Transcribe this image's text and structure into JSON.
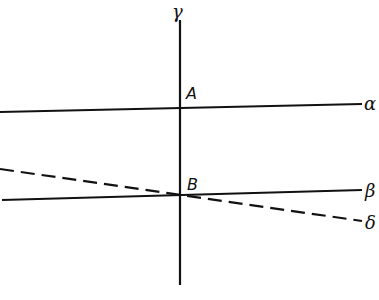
{
  "diagram": {
    "lines": {
      "gamma": {
        "label": "γ",
        "style": "solid",
        "x1": 180,
        "y1": 20,
        "x2": 180,
        "y2": 285
      },
      "alpha": {
        "label": "α",
        "style": "solid",
        "x1": 0,
        "y1": 112,
        "x2": 362,
        "y2": 104
      },
      "beta": {
        "label": "β",
        "style": "solid",
        "x1": 0,
        "y1": 200,
        "x2": 362,
        "y2": 190
      },
      "delta": {
        "label": "δ",
        "style": "dashed",
        "x1": 0,
        "y1": 169,
        "x2": 362,
        "y2": 221
      }
    },
    "points": {
      "A": {
        "label": "A"
      },
      "B": {
        "label": "B"
      }
    },
    "colors": {
      "ink": "#111111",
      "background": "#ffffff"
    }
  }
}
